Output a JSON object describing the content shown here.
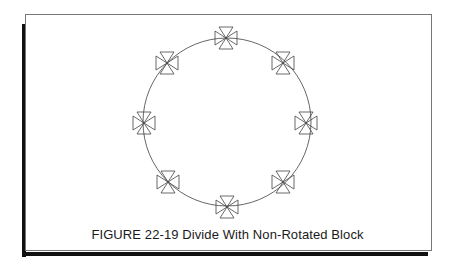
{
  "figure": {
    "caption": "FIGURE 22-19  Divide With Non-Rotated Block",
    "circle": {
      "cx": 227,
      "cy": 122,
      "r": 84
    },
    "block_name": "bowtie-block",
    "block_count": 8,
    "block_rotation": "non-rotated",
    "line_color": "#555555"
  }
}
